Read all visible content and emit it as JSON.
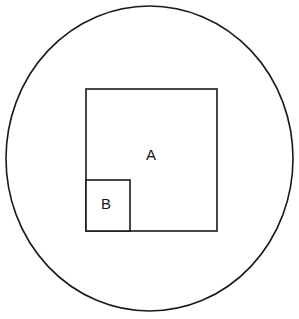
{
  "diagram": {
    "background_color": "#ffffff",
    "stroke_color": "#1a1a1a",
    "label_color": "#161616",
    "canvas": {
      "width": 299,
      "height": 319
    },
    "circle": {
      "name": "outer-circle",
      "cx": 149.5,
      "cy": 158.5,
      "rx": 143.5,
      "ry": 152.5,
      "stroke_width": 1.6,
      "fill": "none"
    },
    "square_a": {
      "name": "square-a",
      "label": "A",
      "x": 86,
      "y": 89,
      "width": 131,
      "height": 142,
      "stroke_width": 1.6,
      "label_x": 151,
      "label_y": 156
    },
    "square_b": {
      "name": "square-b",
      "label": "B",
      "x": 86,
      "y": 180,
      "width": 44,
      "height": 51,
      "stroke_width": 1.6,
      "label_x": 106,
      "label_y": 205
    }
  }
}
